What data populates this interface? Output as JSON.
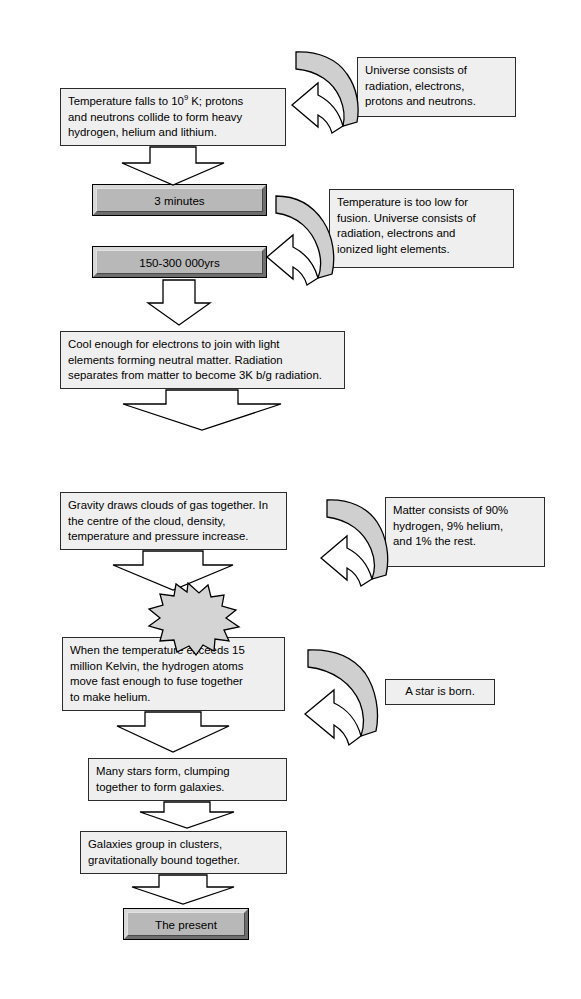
{
  "diagram": {
    "colors": {
      "box_fill": "#efefef",
      "box_stroke": "#2b2b2b",
      "timebox_fill": "#b8b8b8",
      "arrow_fill": "#ffffff",
      "arrow_band_fill": "#cfcfcf",
      "star_fill": "#d4d4d4",
      "page_bg": "#ffffff"
    },
    "boxes": {
      "temperature_falls": {
        "line1_a": "Temperature falls to 10",
        "line1_sup": "9",
        "line1_b": " K; protons",
        "line2": "and neutrons collide to form heavy",
        "line3": "hydrogen, helium and lithium."
      },
      "universe_consists": {
        "line1": "Universe consists of",
        "line2": "radiation, electrons,",
        "line3": "protons and neutrons."
      },
      "three_minutes": "3 minutes",
      "years_150_300k": "150-300 000yrs",
      "temperature_too_low": {
        "line1": "Temperature is too low for",
        "line2": "fusion. Universe consists of",
        "line3": "radiation, electrons and",
        "line4": "ionized light elements."
      },
      "cool_enough": {
        "line1": "Cool enough for electrons to join with light",
        "line2": "elements forming neutral matter. Radiation",
        "line3": "separates from matter to become 3K b/g radiation."
      },
      "gravity_draws": {
        "line1": "Gravity draws clouds of gas together. In",
        "line2": "the centre of the cloud, density,",
        "line3": "temperature and pressure increase."
      },
      "matter_consists": {
        "line1": "Matter consists of 90%",
        "line2": "hydrogen, 9% helium,",
        "line3": "and 1% the rest."
      },
      "bang": "BANG!",
      "when_temperature": {
        "line1": "When the temperature exceeds 15",
        "line2": "million Kelvin, the hydrogen atoms",
        "line3": "move fast enough to fuse together",
        "line4": "to make helium."
      },
      "a_star_is_born": "A star is born.",
      "many_stars": {
        "line1": "Many stars form, clumping",
        "line2": "together to form galaxies."
      },
      "galaxies_group": {
        "line1": "Galaxies group in clusters,",
        "line2": "gravitationally bound together."
      },
      "the_present": "The present"
    }
  }
}
